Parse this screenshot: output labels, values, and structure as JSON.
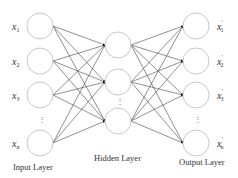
{
  "diagram": {
    "type": "neural-network",
    "layers": {
      "input": {
        "label": "Input Layer",
        "nodes": [
          "x1",
          "x2",
          "x3",
          "xn"
        ]
      },
      "hidden": {
        "label": "Hidden Layer",
        "nodes": [
          "h1",
          "h2",
          "hn"
        ]
      },
      "output": {
        "label": "Output Layer",
        "nodes": [
          "x'1",
          "x'2",
          "x'3",
          "x'n"
        ]
      }
    },
    "input_labels": [
      {
        "base": "x",
        "sub": "1"
      },
      {
        "base": "x",
        "sub": "2"
      },
      {
        "base": "x",
        "sub": "3"
      },
      {
        "base": "x",
        "sub": "n"
      }
    ],
    "output_labels": [
      {
        "base": "x",
        "sub": "1",
        "prime": "'"
      },
      {
        "base": "x",
        "sub": "2",
        "prime": "'"
      },
      {
        "base": "x",
        "sub": "3",
        "prime": "'"
      },
      {
        "base": "x",
        "sub": "n",
        "prime": "'"
      }
    ],
    "ellipsis": "⋮",
    "connections": "fully-connected"
  }
}
